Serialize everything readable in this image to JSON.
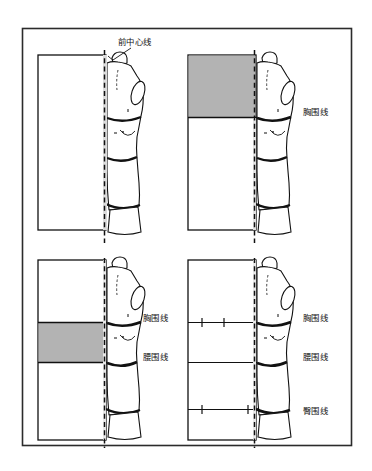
{
  "figure": {
    "title_visible": false,
    "frame": {
      "x": 22,
      "y": 28,
      "width": 330,
      "height": 418,
      "stroke": "#2b2b2b"
    },
    "background": "#ffffff",
    "ink": "#111111",
    "shade_color": "#b3b3b3",
    "panel_count": 4
  },
  "panels": [
    {
      "id": "panel-1",
      "position": "top-left",
      "shaded_region": "none",
      "labels": [
        {
          "name": "front-center-line",
          "text": "前中心线",
          "x": 118,
          "y": 44,
          "leader": true
        }
      ],
      "body_lines_marked": [
        "bust",
        "waist",
        "hip"
      ],
      "has_tick_marks": false
    },
    {
      "id": "panel-2",
      "position": "top-right",
      "shaded_region": "above-bust-line",
      "labels": [
        {
          "name": "bust-line",
          "text": "胸围线",
          "x": 303,
          "y": 112,
          "leader": false
        }
      ],
      "body_lines_marked": [
        "bust",
        "waist",
        "hip"
      ],
      "has_tick_marks": false
    },
    {
      "id": "panel-3",
      "position": "bottom-left",
      "shaded_region": "between-bust-and-waist-line",
      "labels": [
        {
          "name": "bust-line",
          "text": "胸围线",
          "x": 143,
          "y": 318,
          "leader": false
        },
        {
          "name": "waist-line",
          "text": "腰围线",
          "x": 143,
          "y": 357,
          "leader": false
        }
      ],
      "body_lines_marked": [
        "bust",
        "waist",
        "hip"
      ],
      "has_tick_marks": false
    },
    {
      "id": "panel-4",
      "position": "bottom-right",
      "shaded_region": "none",
      "labels": [
        {
          "name": "bust-line",
          "text": "胸围线",
          "x": 303,
          "y": 318,
          "leader": false
        },
        {
          "name": "waist-line",
          "text": "腰围线",
          "x": 303,
          "y": 357,
          "leader": false
        },
        {
          "name": "hip-line",
          "text": "臀围线",
          "x": 303,
          "y": 411,
          "leader": false
        }
      ],
      "body_lines_marked": [
        "bust",
        "waist",
        "hip"
      ],
      "has_tick_marks": true
    }
  ],
  "legend_terms": {
    "front_center_line": "前中心线",
    "bust_line": "胸围线",
    "waist_line": "腰围线",
    "hip_line": "臀围线"
  }
}
